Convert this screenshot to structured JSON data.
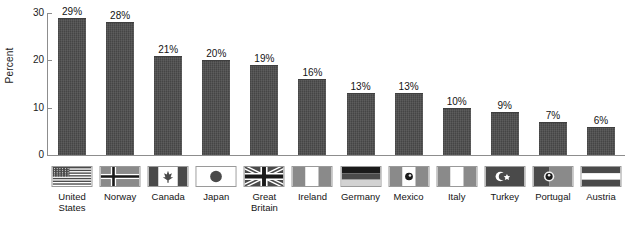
{
  "chart_data": {
    "type": "bar",
    "title": "",
    "xlabel": "",
    "ylabel": "Percent",
    "ylim": [
      0,
      30
    ],
    "yticks": [
      0,
      10,
      20,
      30
    ],
    "grid": false,
    "legend": "none",
    "categories": [
      "United States",
      "Norway",
      "Canada",
      "Japan",
      "Great Britain",
      "Ireland",
      "Germany",
      "Mexico",
      "Italy",
      "Turkey",
      "Portugal",
      "Austria"
    ],
    "category_lines": [
      [
        "United",
        "States"
      ],
      [
        "Norway"
      ],
      [
        "Canada"
      ],
      [
        "Japan"
      ],
      [
        "Great",
        "Britain"
      ],
      [
        "Ireland"
      ],
      [
        "Germany"
      ],
      [
        "Mexico"
      ],
      [
        "Italy"
      ],
      [
        "Turkey"
      ],
      [
        "Portugal"
      ],
      [
        "Austria"
      ]
    ],
    "values": [
      29,
      28,
      21,
      20,
      19,
      16,
      13,
      13,
      10,
      9,
      7,
      6
    ],
    "data_labels": [
      "29%",
      "28%",
      "21%",
      "20%",
      "19%",
      "16%",
      "13%",
      "13%",
      "10%",
      "9%",
      "7%",
      "6%"
    ],
    "bar_color": "#4d4d4d",
    "axis_color": "#8d8d8d",
    "text_color": "#141414",
    "flags": [
      "flag-united-states",
      "flag-norway",
      "flag-canada",
      "flag-japan",
      "flag-great-britain",
      "flag-ireland",
      "flag-germany",
      "flag-mexico",
      "flag-italy",
      "flag-turkey",
      "flag-portugal",
      "flag-austria"
    ]
  },
  "axis": {
    "y_title": "Percent",
    "y_tick_labels": [
      "0",
      "10",
      "20",
      "30"
    ]
  }
}
